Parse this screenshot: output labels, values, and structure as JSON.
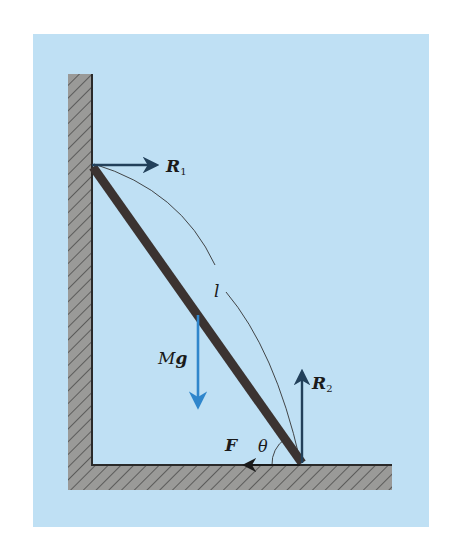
{
  "figure": {
    "colors": {
      "page_background": "#ffffff",
      "panel_background": "#bfe0f4",
      "hatch_fill": "#9a9a98",
      "hatch_lines": "#3a3a3a",
      "surface_line": "#2a2a2a",
      "ladder": "#3b3331",
      "force_arrows": "#22405a",
      "gravity_arrow": "#2f86cc",
      "length_arc": "#333333",
      "label_text": "#1a1a1a"
    },
    "labels": {
      "reaction_wall": "R",
      "reaction_wall_sub": "1",
      "reaction_floor": "R",
      "reaction_floor_sub": "2",
      "length": "l",
      "weight_M": "M",
      "weight_g": "g",
      "friction": "F",
      "angle": "θ"
    }
  }
}
